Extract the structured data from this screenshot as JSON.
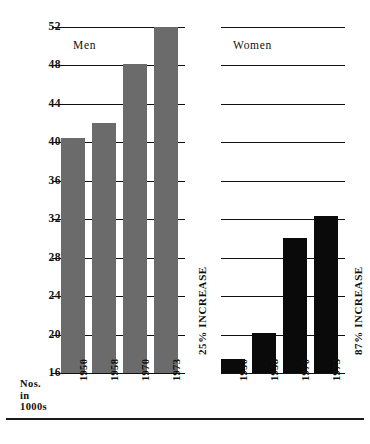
{
  "chart_data": {
    "type": "bar",
    "title": "",
    "xlabel": "",
    "ylabel": "Nos. in 1000s",
    "ylim": [
      16,
      52
    ],
    "ytick_step": 4,
    "yticks": [
      16,
      20,
      24,
      28,
      32,
      36,
      40,
      44,
      48,
      52
    ],
    "grid": true,
    "legend_position": "none",
    "categories": [
      "1950",
      "1958",
      "1970",
      "1973"
    ],
    "panels": [
      {
        "name": "Men",
        "caption": "Men",
        "annotation": "25% INCREASE",
        "color": "#6b6b6b",
        "values": [
          40.5,
          42.0,
          48.2,
          52.0
        ]
      },
      {
        "name": "Women",
        "caption": "Women",
        "annotation": "87% INCREASE",
        "color": "#0a0a0a",
        "values": [
          17.5,
          20.2,
          30.0,
          32.3
        ]
      }
    ],
    "series": [
      {
        "name": "Men",
        "values": [
          40.5,
          42.0,
          48.2,
          52.0
        ]
      },
      {
        "name": "Women",
        "values": [
          17.5,
          20.2,
          30.0,
          32.3
        ]
      }
    ]
  },
  "axis": {
    "unit_caption_line1": "Nos.",
    "unit_caption_line2": "in",
    "unit_caption_line3": "1000s"
  }
}
